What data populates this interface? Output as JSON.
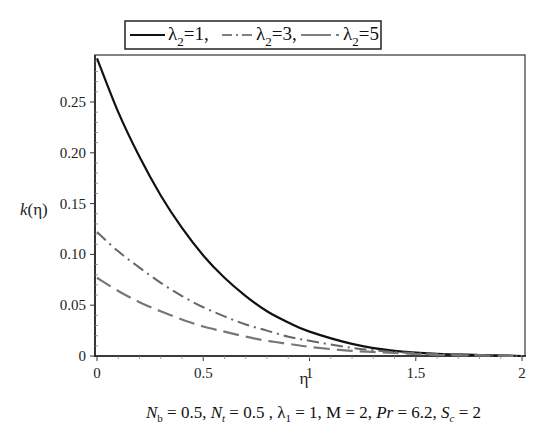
{
  "chart_data": {
    "type": "line",
    "title": "",
    "xlabel": "η",
    "ylabel": "k(η)",
    "xlim": [
      0,
      2
    ],
    "ylim": [
      0,
      0.295
    ],
    "x_ticks": [
      "0",
      "0.5",
      "1",
      "1.5",
      "2"
    ],
    "y_ticks": [
      "0",
      "0.05",
      "0.10",
      "0.15",
      "0.20",
      "0.25"
    ],
    "grid": false,
    "legend_position": "top, outside plot",
    "legend": [
      "λ2=1",
      "λ2=3",
      "λ2=5"
    ],
    "x": [
      0,
      0.1,
      0.2,
      0.3,
      0.4,
      0.5,
      0.6,
      0.7,
      0.8,
      0.9,
      1.0,
      1.2,
      1.4,
      1.6,
      1.8,
      2.0
    ],
    "series": [
      {
        "name": "λ2=1",
        "style": "solid",
        "color": "#111111",
        "values": [
          0.293,
          0.24,
          0.196,
          0.158,
          0.126,
          0.099,
          0.077,
          0.059,
          0.044,
          0.033,
          0.024,
          0.012,
          0.005,
          0.002,
          0.001,
          0.0
        ]
      },
      {
        "name": "λ2=3",
        "style": "dash-dot",
        "color": "#666666",
        "values": [
          0.122,
          0.103,
          0.087,
          0.072,
          0.059,
          0.048,
          0.039,
          0.031,
          0.025,
          0.019,
          0.015,
          0.008,
          0.004,
          0.002,
          0.001,
          0.0
        ]
      },
      {
        "name": "λ2=5",
        "style": "long-dash",
        "color": "#777777",
        "values": [
          0.077,
          0.064,
          0.053,
          0.044,
          0.036,
          0.029,
          0.024,
          0.019,
          0.015,
          0.012,
          0.009,
          0.005,
          0.003,
          0.001,
          0.0005,
          0.0
        ]
      }
    ],
    "annotation": "Nb = 0.5, Nt = 0.5 , λ1 = 1, M = 2, Pr = 6.2, Sc = 2"
  },
  "legend": {
    "items": [
      {
        "symbol": "λ",
        "sub": "2",
        "value": "=1,"
      },
      {
        "symbol": "λ",
        "sub": "2",
        "value": "=3,"
      },
      {
        "symbol": "λ",
        "sub": "2",
        "value": "=5"
      }
    ]
  },
  "axes": {
    "x_title": "η",
    "y_title_k": "k",
    "y_title_arg": "(η)"
  },
  "params": {
    "nb_sym": "N",
    "nb_sub": "b",
    "nb_val": " = 0.5, ",
    "nt_sym": "N",
    "nt_sub": "t",
    "nt_val": " = 0.5 , ",
    "l1_sym": "λ",
    "l1_sub": "1",
    "l1_val": " = 1, M = 2, ",
    "pr_sym": "Pr",
    "pr_val": " = 6.2, ",
    "sc_sym": "S",
    "sc_sub": "c",
    "sc_val": " = 2"
  }
}
